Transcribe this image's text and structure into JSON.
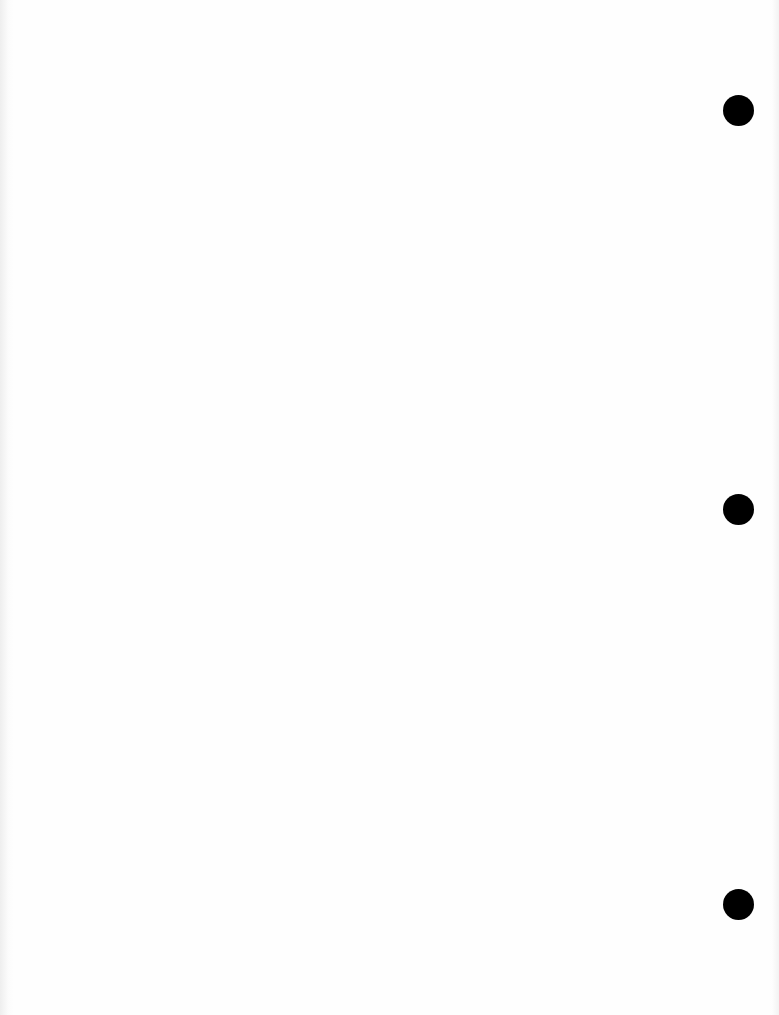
{
  "document": {
    "type": "blank scanned page",
    "text": "",
    "background_color": "#fefefe"
  },
  "punch_holes": [
    {
      "cx": 738,
      "cy": 110,
      "diameter": 31,
      "color": "#000000"
    },
    {
      "cx": 738,
      "cy": 509,
      "diameter": 31,
      "color": "#000000"
    },
    {
      "cx": 738,
      "cy": 904,
      "diameter": 31,
      "color": "#000000"
    }
  ]
}
